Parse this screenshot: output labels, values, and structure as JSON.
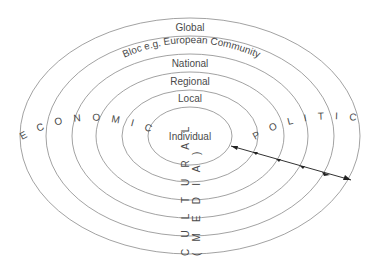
{
  "diagram": {
    "type": "concentric-ellipses",
    "levels": [
      {
        "label": "Global"
      },
      {
        "label": "Bloc e.g. European Community"
      },
      {
        "label": "National"
      },
      {
        "label": "Regional"
      },
      {
        "label": "Local"
      },
      {
        "label": "Individual"
      }
    ],
    "dimensions": {
      "economic": "E C O N O M I C",
      "political": "P O L I T I C A L",
      "cultural": "C U L T U R A L",
      "media": "( M E D I A )"
    },
    "colors": {
      "stroke": "#8a8a8a",
      "text": "#4a4a4a",
      "arrow": "#222222"
    }
  }
}
